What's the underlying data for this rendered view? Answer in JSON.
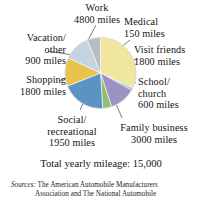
{
  "chart_data": {
    "type": "pie",
    "title": "",
    "unit": "miles",
    "total_label": "Total yearly mileage:  15,000",
    "total_value": 15000,
    "categories": [
      "Work",
      "Medical",
      "Visit friends",
      "School/ church",
      "Family business",
      "Social/ recreational",
      "Shopping",
      "Vacation/ other"
    ],
    "values": [
      4800,
      150,
      1800,
      600,
      3000,
      1950,
      1800,
      900
    ],
    "colors": [
      "#f0e6a0",
      "#9fb7d4",
      "#9b93c4",
      "#8fbf6e",
      "#5b93c4",
      "#e8c24a",
      "#c3d3e2",
      "#b9bcc0"
    ],
    "legend_position": "callout-labels",
    "slices": [
      {
        "id": "work",
        "name": "Work",
        "value": 4800,
        "value_text": "4800 miles",
        "angle_deg": 115.2,
        "color": "#f0e6a0",
        "label_lines": [
          "Work",
          "4800 miles"
        ]
      },
      {
        "id": "medical",
        "name": "Medical",
        "value": 150,
        "value_text": "150 miles",
        "angle_deg": 3.6,
        "color": "#9fb7d4",
        "label_lines": [
          "Medical",
          "150 miles"
        ]
      },
      {
        "id": "friends",
        "name": "Visit friends",
        "value": 1800,
        "value_text": "1800 miles",
        "angle_deg": 43.2,
        "color": "#9b93c4",
        "label_lines": [
          "Visit friends",
          "1800 miles"
        ]
      },
      {
        "id": "school",
        "name": "School/ church",
        "value": 600,
        "value_text": "600 miles",
        "angle_deg": 14.4,
        "color": "#8fbf6e",
        "label_lines": [
          "School/",
          "church",
          "600 miles"
        ]
      },
      {
        "id": "family",
        "name": "Family business",
        "value": 3000,
        "value_text": "3000 miles",
        "angle_deg": 72.0,
        "color": "#5b93c4",
        "label_lines": [
          "Family business",
          "3000 miles"
        ]
      },
      {
        "id": "social",
        "name": "Social/ recreational",
        "value": 1950,
        "value_text": "1950 miles",
        "angle_deg": 46.8,
        "color": "#e8c24a",
        "label_lines": [
          "Social/",
          "recreational",
          "1950 miles"
        ]
      },
      {
        "id": "shopping",
        "name": "Shopping",
        "value": 1800,
        "value_text": "1800 miles",
        "angle_deg": 43.2,
        "color": "#c3d3e2",
        "label_lines": [
          "Shopping",
          "1800 miles"
        ]
      },
      {
        "id": "vacation",
        "name": "Vacation/ other",
        "value": 900,
        "value_text": "900 miles",
        "angle_deg": 21.6,
        "color": "#b9bcc0",
        "label_lines": [
          "Vacation/",
          "other",
          "900 miles"
        ]
      }
    ]
  },
  "labels": {
    "work": {
      "l1": "Work",
      "l2": "4800 miles",
      "l3": ""
    },
    "vacation": {
      "l1": "Vacation/",
      "l2": "other",
      "l3": "900 miles"
    },
    "shopping": {
      "l1": "Shopping",
      "l2": "1800 miles",
      "l3": ""
    },
    "social": {
      "l1": "Social/",
      "l2": "recreational",
      "l3": "1950 miles"
    },
    "family": {
      "l1": "Family business",
      "l2": "3000 miles",
      "l3": ""
    },
    "school": {
      "l1": "School/",
      "l2": "church",
      "l3": "600 miles"
    },
    "friends": {
      "l1": "Visit friends",
      "l2": "1800 miles",
      "l3": ""
    },
    "medical": {
      "l1": "Medical",
      "l2": "150 miles",
      "l3": ""
    }
  },
  "footer": {
    "total": "Total yearly mileage:  15,000",
    "sources_word": "Sources:",
    "sources_line1": "The American Automobile Manufacturers",
    "sources_line2": "Association and The National Automobile"
  }
}
